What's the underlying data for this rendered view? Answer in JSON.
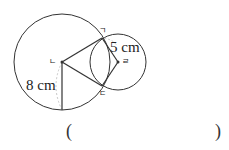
{
  "diagram": {
    "points": {
      "a": "ㄱ",
      "b": "ㄴ",
      "c": "ㄷ",
      "d": "ㄹ"
    },
    "lengths": {
      "small_radius": "5 cm",
      "large_radius": "8 cm"
    },
    "answer": {
      "open": "(",
      "close": ")",
      "value": ""
    },
    "colors": {
      "stroke": "#333333",
      "dashed": "#bbbbbb"
    }
  }
}
